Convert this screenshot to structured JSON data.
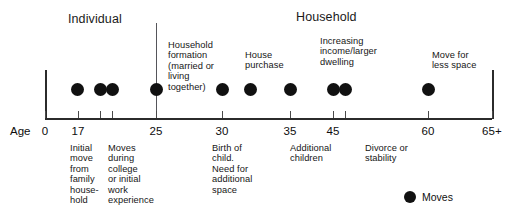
{
  "figure": {
    "title_left": "Individual",
    "title_right": "Household",
    "axis_prefix": "Age"
  },
  "axis": {
    "ticks": [
      {
        "label": "0",
        "x": 45
      },
      {
        "label": "17",
        "x": 78
      },
      {
        "label": "25",
        "x": 156
      },
      {
        "label": "30",
        "x": 222
      },
      {
        "label": "35",
        "x": 290
      },
      {
        "label": "45",
        "x": 333
      },
      {
        "label": "60",
        "x": 428
      },
      {
        "label": "65+",
        "x": 492
      }
    ],
    "minor_ticks_x": [
      100,
      112,
      345
    ],
    "left_x": 45,
    "right_x": 492,
    "baseline_y": 118
  },
  "moves": [
    {
      "x": 77,
      "label": "move at 17"
    },
    {
      "x": 100,
      "label": "move during college"
    },
    {
      "x": 112,
      "label": "move initial work"
    },
    {
      "x": 156,
      "label": "household formation move"
    },
    {
      "x": 222,
      "label": "house purchase move"
    },
    {
      "x": 250,
      "label": "birth of child move"
    },
    {
      "x": 290,
      "label": "additional children move"
    },
    {
      "x": 333,
      "label": "increasing income move"
    },
    {
      "x": 345,
      "label": "larger dwelling move"
    },
    {
      "x": 428,
      "label": "move for less space"
    }
  ],
  "annotations_above": [
    {
      "text": "Household\nformation\n(married or\nliving\ntogether)",
      "x": 168,
      "y": 40,
      "width": 60
    },
    {
      "text": "House\npurchase",
      "x": 245,
      "y": 50,
      "width": 56
    },
    {
      "text": "Increasing\nincome/larger\ndwelling",
      "x": 320,
      "y": 36,
      "width": 72
    },
    {
      "text": "Move for\nless space",
      "x": 432,
      "y": 50,
      "width": 58
    }
  ],
  "annotations_below": [
    {
      "text": "Initial\nmove\nfrom\nfamily\nhouse-\nhold",
      "x": 70,
      "y": 143,
      "width": 40
    },
    {
      "text": "Moves\nduring\ncollege\nor initial\nwork\nexperience",
      "x": 108,
      "y": 143,
      "width": 62
    },
    {
      "text": "Birth of\nchild.\nNeed for\nadditional\nspace",
      "x": 212,
      "y": 143,
      "width": 58
    },
    {
      "text": "Additional\nchildren",
      "x": 290,
      "y": 143,
      "width": 62
    },
    {
      "text": "Divorce or\nstability",
      "x": 365,
      "y": 143,
      "width": 62
    }
  ],
  "legend": {
    "label": "Moves",
    "x": 404,
    "y": 191
  },
  "divider": {
    "x": 156,
    "top": 23,
    "height": 95
  }
}
